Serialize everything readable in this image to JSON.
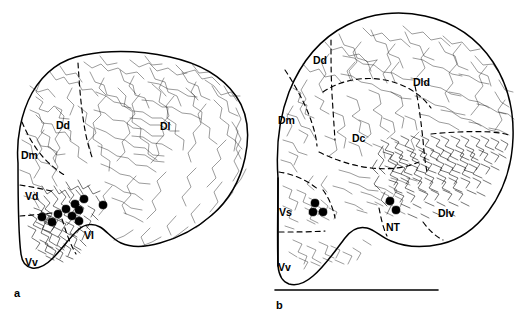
{
  "figure": {
    "background_color": "#ffffff",
    "ink_color": "#000000",
    "width": 526,
    "height": 327
  },
  "panels": [
    {
      "letter": "a",
      "name": "panel-a",
      "description": "Rostral transverse section of telencephalon showing fiber labeling and retrogradely labeled somata concentrated in the ventral nucleus region",
      "labels": [
        {
          "text": "Dd",
          "x": 56,
          "y": 120,
          "name": "region-label-dd"
        },
        {
          "text": "Dl",
          "x": 160,
          "y": 121,
          "name": "region-label-dl"
        },
        {
          "text": "Dm",
          "x": 21,
          "y": 150,
          "name": "region-label-dm"
        },
        {
          "text": "Vd",
          "x": 25,
          "y": 191,
          "name": "region-label-vd"
        },
        {
          "text": "Vl",
          "x": 84,
          "y": 230,
          "name": "region-label-vl"
        },
        {
          "text": "Vv",
          "x": 25,
          "y": 257,
          "name": "region-label-vv"
        }
      ],
      "soma_count": 10,
      "soma_positions": [
        {
          "x": 42,
          "y": 217
        },
        {
          "x": 52,
          "y": 222
        },
        {
          "x": 58,
          "y": 214
        },
        {
          "x": 66,
          "y": 209
        },
        {
          "x": 72,
          "y": 216
        },
        {
          "x": 75,
          "y": 204
        },
        {
          "x": 78,
          "y": 210
        },
        {
          "x": 84,
          "y": 199
        },
        {
          "x": 79,
          "y": 221
        },
        {
          "x": 103,
          "y": 205
        }
      ]
    },
    {
      "letter": "b",
      "name": "panel-b",
      "description": "Caudal transverse section of telencephalon showing dense terminal field in Dlv and labeled somata in Vs and near NT",
      "labels": [
        {
          "text": "Dd",
          "x": 50,
          "y": 55,
          "name": "region-label-dd"
        },
        {
          "text": "Dld",
          "x": 150,
          "y": 77,
          "name": "region-label-dld"
        },
        {
          "text": "Dm",
          "x": 15,
          "y": 115,
          "name": "region-label-dm"
        },
        {
          "text": "Dc",
          "x": 89,
          "y": 133,
          "name": "region-label-dc"
        },
        {
          "text": "Dlv",
          "x": 175,
          "y": 208,
          "name": "region-label-dlv"
        },
        {
          "text": "Vs",
          "x": 16,
          "y": 207,
          "name": "region-label-vs"
        },
        {
          "text": "NT",
          "x": 123,
          "y": 222,
          "name": "region-label-nt"
        },
        {
          "text": "Vv",
          "x": 15,
          "y": 262,
          "name": "region-label-vv"
        }
      ],
      "soma_count": 5,
      "soma_positions": [
        {
          "x": 52,
          "y": 203
        },
        {
          "x": 50,
          "y": 212
        },
        {
          "x": 60,
          "y": 212
        },
        {
          "x": 127,
          "y": 201
        },
        {
          "x": 133,
          "y": 210
        }
      ]
    }
  ],
  "legend_keys": {
    "filled_dot": "retrogradely labeled neuronal soma",
    "fine_lines": "anterogradely labeled fibers and terminals"
  }
}
